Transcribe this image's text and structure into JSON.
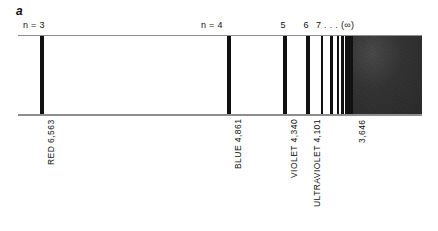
{
  "figure": {
    "panel_letter": "a",
    "caption_present": false
  },
  "strip": {
    "left_px": 18,
    "top_px": 36,
    "width_px": 404,
    "height_px": 78,
    "rule_color": "#8d8d8d",
    "line_color": "#111111",
    "background_color": "#ffffff"
  },
  "continuum": {
    "label": "continuum",
    "start_px": 353,
    "end_px": 422,
    "color": "#343434"
  },
  "chart_data": {
    "type": "spectrum",
    "xlabel": "",
    "ylabel": "",
    "axis_note": "Horizontal scale is wavelength, decreasing left to right (angstroms)",
    "top_labels": [
      {
        "text": "n = 3",
        "x_px": 34
      },
      {
        "text": "n = 4",
        "x_px": 212
      },
      {
        "text": "5",
        "x_px": 283
      },
      {
        "text": "6",
        "x_px": 306
      },
      {
        "text": "7 . . . (∞)",
        "x_px": 320
      }
    ],
    "lines": [
      {
        "n": 3,
        "wavelength": "6,563",
        "label": "RED 6,563",
        "color_name": "RED",
        "x_px": 42,
        "width_px": 4.6,
        "labeled": true
      },
      {
        "n": 4,
        "wavelength": "4,861",
        "label": "BLUE 4,861",
        "color_name": "BLUE",
        "x_px": 229,
        "width_px": 4.2,
        "labeled": true
      },
      {
        "n": 5,
        "wavelength": "4,340",
        "label": "VIOLET 4,340",
        "color_name": "VIOLET",
        "x_px": 285,
        "width_px": 3.6,
        "labeled": true
      },
      {
        "n": 6,
        "wavelength": "4,101",
        "label": "ULTRAVIOLET 4,101",
        "color_name": "ULTRAVIOLET",
        "x_px": 308,
        "width_px": 3.4,
        "labeled": true
      },
      {
        "n": 7,
        "wavelength": "3,970",
        "label": "",
        "color_name": "",
        "x_px": 322,
        "width_px": 2.8,
        "labeled": false
      },
      {
        "n": 8,
        "wavelength": "3,889",
        "label": "",
        "color_name": "",
        "x_px": 331.5,
        "width_px": 2.6,
        "labeled": false
      },
      {
        "n": 9,
        "wavelength": "3,835",
        "label": "",
        "color_name": "",
        "x_px": 338,
        "width_px": 2.3,
        "labeled": false
      },
      {
        "n": 10,
        "wavelength": "3,798",
        "label": "",
        "color_name": "",
        "x_px": 342.5,
        "width_px": 2.1,
        "labeled": false
      },
      {
        "n": 11,
        "wavelength": "3,770",
        "label": "",
        "color_name": "",
        "x_px": 345.8,
        "width_px": 1.9,
        "labeled": false
      },
      {
        "n": 12,
        "wavelength": "3,750",
        "label": "",
        "color_name": "",
        "x_px": 348.2,
        "width_px": 1.7,
        "labeled": false
      },
      {
        "n": 13,
        "wavelength": "3,734",
        "label": "",
        "color_name": "",
        "x_px": 350.0,
        "width_px": 1.5,
        "labeled": false
      },
      {
        "n": 14,
        "wavelength": "3,722",
        "label": "",
        "color_name": "",
        "x_px": 351.4,
        "width_px": 1.3,
        "labeled": false
      },
      {
        "n": 15,
        "wavelength": "3,712",
        "label": "",
        "color_name": "",
        "x_px": 352.5,
        "width_px": 1.1,
        "labeled": false
      }
    ],
    "series_limit": {
      "wavelength": "3,646",
      "label": "3,646",
      "x_px": 353
    },
    "bottom_labels": [
      {
        "text": "RED 6,563",
        "x_px": 42
      },
      {
        "text": "BLUE 4,861",
        "x_px": 229
      },
      {
        "text": "VIOLET 4,340",
        "x_px": 285
      },
      {
        "text": "ULTRAVIOLET 4,101",
        "x_px": 308
      },
      {
        "text": "3,646",
        "x_px": 353
      }
    ]
  }
}
